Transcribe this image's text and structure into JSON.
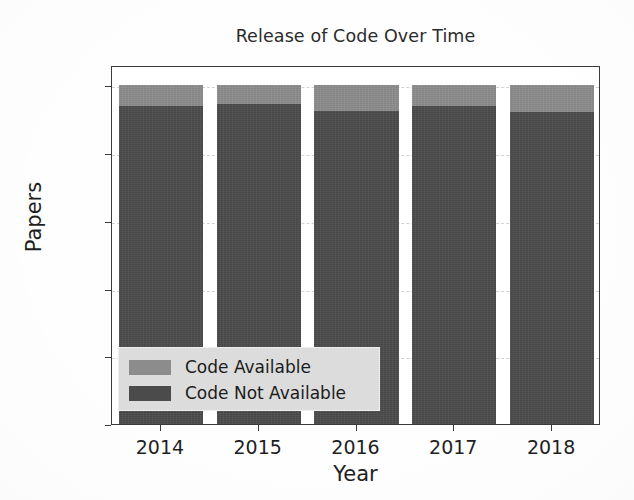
{
  "chart_data": {
    "type": "bar",
    "stacked": true,
    "title": "Release of Code Over Time",
    "xlabel": "Year",
    "ylabel": "Papers",
    "categories": [
      "2014",
      "2015",
      "2016",
      "2017",
      "2018"
    ],
    "series": [
      {
        "name": "Code Not Available",
        "color": "#4b4b4b",
        "values": [
          94,
          94.5,
          92.5,
          94,
          92
        ]
      },
      {
        "name": "Code Available",
        "color": "#8c8c8c",
        "values": [
          6,
          5.5,
          7.5,
          6,
          8
        ]
      }
    ],
    "totals": [
      100,
      100,
      100,
      100,
      100
    ],
    "ylim": [
      0,
      106
    ],
    "xlim": [
      2013.5,
      2018.5
    ],
    "yticks": [
      0,
      20,
      40,
      60,
      80,
      100
    ],
    "ytick_labels": [
      "0",
      "20",
      "40",
      "60",
      "80",
      "100"
    ],
    "xtick_labels": [
      "2014",
      "2015",
      "2016",
      "2017",
      "2018"
    ],
    "grid": true,
    "grid_style": "dashed",
    "grid_color": "#d2d2d2",
    "legend": {
      "position": "lower left",
      "background": "#dcdcdc",
      "entries": [
        {
          "label": "Code Available",
          "color": "#8c8c8c"
        },
        {
          "label": "Code Not Available",
          "color": "#4b4b4b"
        }
      ]
    },
    "axis_color": "#3a3a3a",
    "text_color": "#1f1f1f",
    "background": "#ffffff"
  }
}
